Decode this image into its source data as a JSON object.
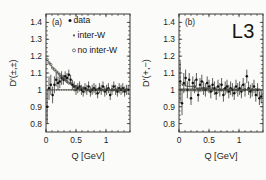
{
  "figure": {
    "brand": "L3",
    "background_color": "#fbfbf9",
    "ink_color": "#1d1d1b"
  },
  "chart_data": [
    {
      "type": "scatter",
      "panel": "(a)",
      "title": "",
      "xlabel": "Q [GeV]",
      "ylabel": "D'(±,±)",
      "xlim": [
        0,
        1.4
      ],
      "ylim": [
        0.75,
        1.45
      ],
      "xticks": [
        0,
        0.5,
        1
      ],
      "xticklabels": [
        "0",
        "0.5",
        "1"
      ],
      "yticks": [
        0.8,
        0.9,
        1,
        1.1,
        1.2,
        1.3,
        1.4
      ],
      "yticklabels": [
        "0.8",
        "0.9",
        "1",
        "1.1",
        "1.2",
        "1.3",
        "1.4"
      ],
      "grid": false,
      "legend_position": "top-left",
      "legend": [
        {
          "label": "data",
          "marker": "filled-circle",
          "color": "#111110"
        },
        {
          "label": "inter-W",
          "marker": "small-filled-circle",
          "color": "#5d5d58"
        },
        {
          "label": "no inter-W",
          "marker": "open-circle",
          "color": "#44443f"
        }
      ],
      "series": [
        {
          "name": "data",
          "marker": "filled-circle",
          "x": [
            0.02,
            0.05,
            0.08,
            0.11,
            0.14,
            0.17,
            0.2,
            0.23,
            0.26,
            0.29,
            0.32,
            0.35,
            0.38,
            0.41,
            0.44,
            0.47,
            0.5,
            0.53,
            0.56,
            0.59,
            0.62,
            0.65,
            0.68,
            0.71,
            0.74,
            0.77,
            0.8,
            0.83,
            0.86,
            0.89,
            0.92,
            0.95,
            0.98,
            1.01,
            1.04,
            1.07,
            1.1,
            1.13,
            1.16,
            1.19,
            1.22,
            1.25,
            1.28,
            1.31,
            1.34,
            1.37
          ],
          "y": [
            0.9,
            1.01,
            1.03,
            0.97,
            1.03,
            1.06,
            1.04,
            1.05,
            1.07,
            1.06,
            1.08,
            1.07,
            1.09,
            1.06,
            1.03,
            1.02,
            1.0,
            1.01,
            1.02,
            1.0,
            0.99,
            1.01,
            1.0,
            1.02,
            0.99,
            1.0,
            1.01,
            1.0,
            0.98,
            1.01,
            1.0,
            1.02,
            0.99,
            1.0,
            1.01,
            0.97,
            1.0,
            1.02,
            1.0,
            0.99,
            1.01,
            1.0,
            1.01,
            0.99,
            1.0,
            1.0
          ],
          "yerr": [
            0.1,
            0.07,
            0.06,
            0.05,
            0.05,
            0.04,
            0.04,
            0.04,
            0.04,
            0.03,
            0.03,
            0.03,
            0.03,
            0.03,
            0.03,
            0.03,
            0.03,
            0.03,
            0.03,
            0.03,
            0.03,
            0.03,
            0.03,
            0.03,
            0.03,
            0.03,
            0.03,
            0.03,
            0.03,
            0.03,
            0.03,
            0.03,
            0.03,
            0.03,
            0.03,
            0.03,
            0.03,
            0.03,
            0.03,
            0.03,
            0.03,
            0.03,
            0.03,
            0.03,
            0.03,
            0.03
          ]
        },
        {
          "name": "inter-W",
          "marker": "small-filled-circle",
          "x": [
            0.02,
            0.06,
            0.1,
            0.14,
            0.18,
            0.22,
            0.26,
            0.3,
            0.34,
            0.38,
            0.42,
            0.46,
            0.5,
            0.56,
            0.62,
            0.68,
            0.74,
            0.8,
            0.86,
            0.92,
            0.98,
            1.04,
            1.1,
            1.16,
            1.22,
            1.28,
            1.34
          ],
          "y": [
            1.0,
            1.0,
            1.0,
            1.0,
            1.0,
            1.0,
            1.0,
            1.0,
            1.0,
            1.0,
            1.0,
            1.0,
            1.0,
            1.0,
            1.0,
            1.0,
            1.0,
            1.0,
            1.0,
            1.0,
            1.0,
            1.0,
            1.0,
            1.0,
            1.0,
            1.0,
            1.0
          ]
        },
        {
          "name": "no inter-W",
          "marker": "open-circle",
          "x": [
            0.02,
            0.05,
            0.08,
            0.11,
            0.14,
            0.17,
            0.2,
            0.23,
            0.26,
            0.29,
            0.32,
            0.35,
            0.38,
            0.41,
            0.44,
            0.47,
            0.5,
            0.56,
            0.62,
            0.68,
            0.74,
            0.8,
            0.86,
            0.92,
            0.98,
            1.04,
            1.1,
            1.16,
            1.22,
            1.28,
            1.34
          ],
          "y": [
            1.18,
            1.16,
            1.15,
            1.13,
            1.12,
            1.11,
            1.1,
            1.09,
            1.08,
            1.07,
            1.06,
            1.05,
            1.04,
            1.04,
            1.03,
            1.02,
            1.02,
            1.01,
            1.01,
            1.0,
            1.0,
            1.0,
            1.0,
            1.0,
            1.0,
            1.0,
            1.0,
            1.0,
            1.0,
            1.0,
            1.0
          ]
        }
      ]
    },
    {
      "type": "scatter",
      "panel": "(b)",
      "title": "",
      "xlabel": "Q [GeV]",
      "ylabel": "D'(+,−)",
      "xlim": [
        0,
        1.4
      ],
      "ylim": [
        0.75,
        1.45
      ],
      "xticks": [
        0,
        0.5,
        1
      ],
      "xticklabels": [
        "0",
        "0.5",
        "1"
      ],
      "yticks": [
        0.8,
        0.9,
        1,
        1.1,
        1.2,
        1.3,
        1.4
      ],
      "yticklabels": [
        "0.8",
        "0.9",
        "1",
        "1.1",
        "1.2",
        "1.3",
        "1.4"
      ],
      "grid": false,
      "legend_position": "none",
      "series": [
        {
          "name": "data",
          "marker": "filled-circle",
          "x": [
            0.02,
            0.05,
            0.08,
            0.11,
            0.14,
            0.17,
            0.2,
            0.23,
            0.26,
            0.29,
            0.32,
            0.35,
            0.38,
            0.41,
            0.44,
            0.47,
            0.5,
            0.53,
            0.56,
            0.59,
            0.62,
            0.65,
            0.68,
            0.71,
            0.74,
            0.77,
            0.8,
            0.83,
            0.86,
            0.89,
            0.92,
            0.95,
            0.98,
            1.01,
            1.04,
            1.07,
            1.1,
            1.13,
            1.16,
            1.19,
            1.22,
            1.25,
            1.28,
            1.31,
            1.34,
            1.37
          ],
          "y": [
            1.05,
            0.92,
            1.04,
            1.07,
            1.0,
            1.06,
            0.95,
            1.04,
            1.02,
            1.06,
            0.97,
            1.03,
            1.05,
            1.01,
            1.0,
            1.04,
            1.02,
            0.99,
            1.03,
            1.01,
            0.98,
            1.02,
            1.0,
            1.03,
            0.97,
            1.01,
            1.02,
            0.99,
            1.01,
            1.0,
            0.98,
            1.02,
            1.0,
            1.01,
            0.99,
            1.03,
            1.0,
            1.08,
            1.01,
            0.99,
            1.0,
            1.02,
            0.97,
            1.0,
            0.95,
            0.96
          ],
          "yerr": [
            0.12,
            0.07,
            0.06,
            0.05,
            0.05,
            0.04,
            0.04,
            0.04,
            0.04,
            0.04,
            0.04,
            0.04,
            0.04,
            0.04,
            0.04,
            0.04,
            0.04,
            0.04,
            0.04,
            0.04,
            0.04,
            0.04,
            0.04,
            0.04,
            0.04,
            0.04,
            0.04,
            0.04,
            0.04,
            0.04,
            0.04,
            0.04,
            0.04,
            0.04,
            0.04,
            0.04,
            0.04,
            0.04,
            0.04,
            0.04,
            0.04,
            0.04,
            0.04,
            0.04,
            0.04,
            0.04
          ]
        },
        {
          "name": "inter-W",
          "marker": "small-filled-circle",
          "x": [
            0.02,
            0.06,
            0.1,
            0.14,
            0.18,
            0.22,
            0.26,
            0.3,
            0.34,
            0.38,
            0.42,
            0.46,
            0.5,
            0.56,
            0.62,
            0.68,
            0.74,
            0.8,
            0.86,
            0.92,
            0.98,
            1.04,
            1.1,
            1.16,
            1.22,
            1.28,
            1.34
          ],
          "y": [
            1.04,
            1.03,
            1.03,
            1.02,
            1.02,
            1.02,
            1.02,
            1.01,
            1.01,
            1.01,
            1.01,
            1.01,
            1.01,
            1.01,
            1.0,
            1.0,
            1.0,
            1.0,
            1.0,
            1.0,
            1.0,
            1.0,
            1.0,
            1.0,
            1.0,
            1.0,
            1.0
          ]
        },
        {
          "name": "no inter-W",
          "marker": "open-circle",
          "x": [
            0.02,
            0.05,
            0.08,
            0.11,
            0.14,
            0.17,
            0.2,
            0.23,
            0.26,
            0.29,
            0.32,
            0.35,
            0.38,
            0.41,
            0.44,
            0.47,
            0.5,
            0.56,
            0.62,
            0.68,
            0.74,
            0.8,
            0.86,
            0.92,
            0.98,
            1.04,
            1.1,
            1.16,
            1.22,
            1.28,
            1.34
          ],
          "y": [
            1.0,
            1.0,
            1.0,
            1.0,
            1.0,
            1.0,
            1.0,
            1.0,
            1.0,
            1.0,
            1.0,
            1.0,
            1.0,
            1.0,
            1.0,
            1.0,
            1.0,
            1.0,
            1.0,
            1.0,
            1.0,
            1.0,
            1.0,
            1.0,
            1.0,
            1.0,
            1.0,
            1.0,
            1.0,
            1.0,
            1.0
          ]
        }
      ]
    }
  ]
}
